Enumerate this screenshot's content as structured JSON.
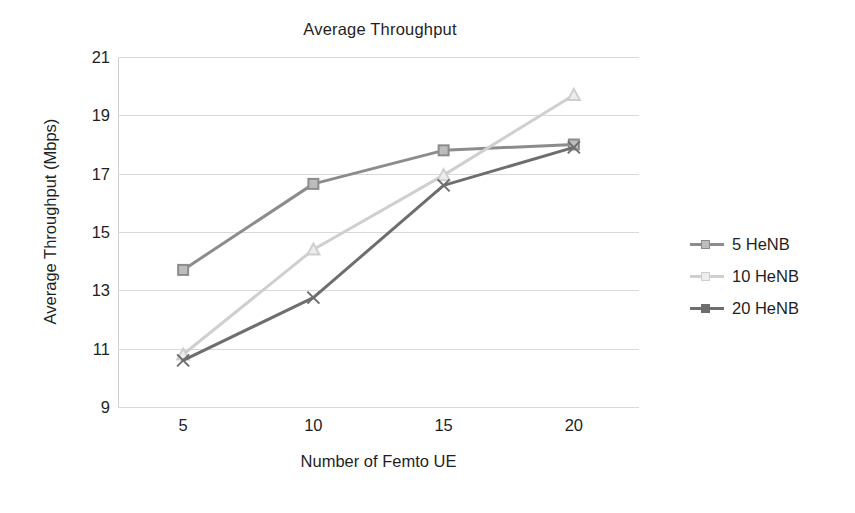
{
  "chart_data": {
    "type": "line",
    "title": "Average Throughput",
    "xlabel": "Number of Femto UE",
    "ylabel": "Average Throughput (Mbps)",
    "x": [
      5,
      10,
      15,
      20
    ],
    "xtick_labels": [
      "5",
      "10",
      "15",
      "20"
    ],
    "ytick_labels": [
      "21",
      "19",
      "17",
      "15",
      "13",
      "11",
      "9"
    ],
    "ytick_values": [
      21,
      19,
      17,
      15,
      13,
      11,
      9
    ],
    "xlim": [
      2.5,
      22.5
    ],
    "ylim": [
      9,
      21
    ],
    "grid": "horizontal",
    "legend_position": "right",
    "series": [
      {
        "name": "5 HeNB",
        "values": [
          13.7,
          16.65,
          17.8,
          18.0
        ],
        "color": "#8c8c8c",
        "marker": "square"
      },
      {
        "name": "10 HeNB",
        "values": [
          10.8,
          14.4,
          16.95,
          19.7
        ],
        "color": "#cfcfcf",
        "marker": "triangle"
      },
      {
        "name": "20 HeNB",
        "values": [
          10.6,
          12.75,
          16.6,
          17.9
        ],
        "color": "#6e6e6e",
        "marker": "cross"
      }
    ]
  },
  "legend": {
    "items": [
      {
        "label": "5 HeNB"
      },
      {
        "label": "10 HeNB"
      },
      {
        "label": "20 HeNB"
      }
    ]
  },
  "caption": {
    "text": ""
  }
}
